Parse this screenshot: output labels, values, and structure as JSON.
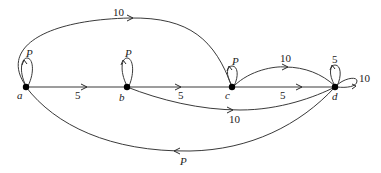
{
  "diagram": {
    "type": "directed-graph",
    "nodes": [
      {
        "id": "a",
        "label": "a"
      },
      {
        "id": "b",
        "label": "b"
      },
      {
        "id": "c",
        "label": "c"
      },
      {
        "id": "d",
        "label": "d"
      }
    ],
    "edges": [
      {
        "id": "a-a",
        "from": "a",
        "to": "a",
        "label": "P"
      },
      {
        "id": "b-b",
        "from": "b",
        "to": "b",
        "label": "P"
      },
      {
        "id": "c-c",
        "from": "c",
        "to": "c",
        "label": "P"
      },
      {
        "id": "d-d-1",
        "from": "d",
        "to": "d",
        "label": "5"
      },
      {
        "id": "d-d-2",
        "from": "d",
        "to": "d",
        "label": "10"
      },
      {
        "id": "a-b",
        "from": "a",
        "to": "b",
        "label": "5"
      },
      {
        "id": "b-c",
        "from": "b",
        "to": "c",
        "label": "5"
      },
      {
        "id": "c-d-straight",
        "from": "c",
        "to": "d",
        "label": "5"
      },
      {
        "id": "c-d-arc",
        "from": "c",
        "to": "d",
        "label": "10"
      },
      {
        "id": "b-d",
        "from": "b",
        "to": "d",
        "label": "10"
      },
      {
        "id": "a-c",
        "from": "a",
        "to": "c",
        "label": "10"
      },
      {
        "id": "d-a",
        "from": "d",
        "to": "a",
        "label": "P"
      }
    ]
  }
}
